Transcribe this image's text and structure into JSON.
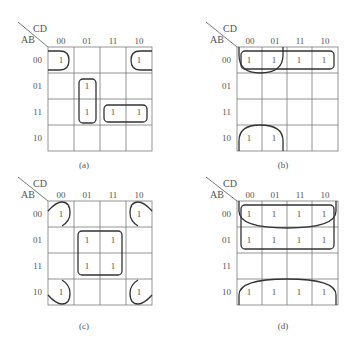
{
  "figure": {
    "row_var": "AB",
    "col_var": "CD",
    "col_labels": [
      "00",
      "01",
      "11",
      "10"
    ],
    "row_labels": [
      "00",
      "01",
      "11",
      "10"
    ],
    "one_symbol": "1",
    "colors": {
      "grid": "#7a7a7a",
      "loop": "#333333",
      "text": "#555555"
    }
  },
  "panels": [
    {
      "id": "a",
      "caption": "(a)",
      "origin": [
        48,
        47
      ],
      "cell": [
        26,
        26
      ],
      "cells_with_one": [
        [
          0,
          0
        ],
        [
          0,
          3
        ],
        [
          1,
          1
        ],
        [
          2,
          1
        ],
        [
          2,
          2
        ],
        [
          2,
          3
        ]
      ],
      "loops": [
        {
          "type": "edge-right-open",
          "desc": "row00 col00 wraps left"
        },
        {
          "type": "edge-left-open",
          "desc": "row00 col10 wraps right"
        },
        {
          "type": "rect",
          "rows": [
            1,
            2
          ],
          "cols": [
            1,
            1
          ]
        },
        {
          "type": "rect",
          "rows": [
            2,
            2
          ],
          "cols": [
            2,
            3
          ]
        }
      ]
    },
    {
      "id": "b",
      "caption": "(b)",
      "origin": [
        237,
        47
      ],
      "cell": [
        25.25,
        26
      ],
      "cells_with_one": [
        [
          0,
          0
        ],
        [
          0,
          1
        ],
        [
          0,
          2
        ],
        [
          0,
          3
        ],
        [
          3,
          0
        ],
        [
          3,
          1
        ]
      ],
      "loops": [
        {
          "type": "rect",
          "rows": [
            0,
            0
          ],
          "cols": [
            0,
            3
          ]
        },
        {
          "type": "edge-top-open",
          "desc": "row00 cols 00-01 wraps to top"
        },
        {
          "type": "edge-bottom-open",
          "desc": "row10 cols 00-01 wraps to bottom"
        }
      ]
    },
    {
      "id": "c",
      "caption": "(c)",
      "origin": [
        48,
        201
      ],
      "cell": [
        26,
        26
      ],
      "cells_with_one": [
        [
          0,
          0
        ],
        [
          0,
          3
        ],
        [
          1,
          1
        ],
        [
          1,
          2
        ],
        [
          2,
          1
        ],
        [
          2,
          2
        ],
        [
          3,
          0
        ],
        [
          3,
          3
        ]
      ],
      "loops": [
        {
          "type": "corner",
          "desc": "four corners"
        },
        {
          "type": "rect",
          "rows": [
            1,
            2
          ],
          "cols": [
            1,
            2
          ]
        }
      ]
    },
    {
      "id": "d",
      "caption": "(d)",
      "origin": [
        237,
        201
      ],
      "cell": [
        25.25,
        26
      ],
      "cells_with_one": [
        [
          0,
          0
        ],
        [
          0,
          1
        ],
        [
          0,
          2
        ],
        [
          0,
          3
        ],
        [
          1,
          0
        ],
        [
          1,
          1
        ],
        [
          1,
          2
        ],
        [
          1,
          3
        ],
        [
          3,
          0
        ],
        [
          3,
          1
        ],
        [
          3,
          2
        ],
        [
          3,
          3
        ]
      ],
      "loops": [
        {
          "type": "rect",
          "rows": [
            0,
            1
          ],
          "cols": [
            0,
            3
          ]
        },
        {
          "type": "edge-top-open",
          "desc": "row00 wraps to top"
        },
        {
          "type": "edge-bottom-open",
          "desc": "row10 wraps to bottom"
        }
      ]
    }
  ]
}
